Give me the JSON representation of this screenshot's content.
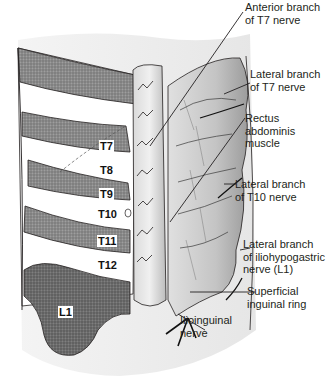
{
  "figure": {
    "segment_labels": [
      {
        "id": "T7",
        "text": "T7",
        "boxed": true
      },
      {
        "id": "T8",
        "text": "T8",
        "boxed": false
      },
      {
        "id": "T9",
        "text": "T9",
        "boxed": true
      },
      {
        "id": "T10",
        "text": "T10",
        "boxed": false
      },
      {
        "id": "T11",
        "text": "T11",
        "boxed": true
      },
      {
        "id": "T12",
        "text": "T12",
        "boxed": false
      },
      {
        "id": "L1",
        "text": "L1",
        "boxed": true
      }
    ],
    "callouts": [
      {
        "id": "anterior-t7",
        "line1": "Anterior branch",
        "line2": "of T7 nerve"
      },
      {
        "id": "lateral-t7",
        "line1": "Lateral branch",
        "line2": "of T7 nerve"
      },
      {
        "id": "rectus",
        "line1": "Rectus",
        "line2": "abdominis",
        "line3": "muscle"
      },
      {
        "id": "lateral-t10",
        "line1": "Lateral branch",
        "line2": "of T10 nerve"
      },
      {
        "id": "lateral-l1",
        "line1": "Lateral branch",
        "line2": "of iliohypogastric",
        "line3": "nerve (L1)"
      },
      {
        "id": "superficial",
        "line1": "Superficial",
        "line2": "inguinal ring"
      },
      {
        "id": "ilioinguinal",
        "line1": "Ilioinguinal",
        "line2": "nerve"
      }
    ],
    "colors": {
      "dermatome_dark": "#7a7a7a",
      "dermatome_mid": "#9a9a9a",
      "skin_light": "#eeeeee",
      "muscle": "#c8c8c8",
      "line": "#231f20"
    }
  }
}
